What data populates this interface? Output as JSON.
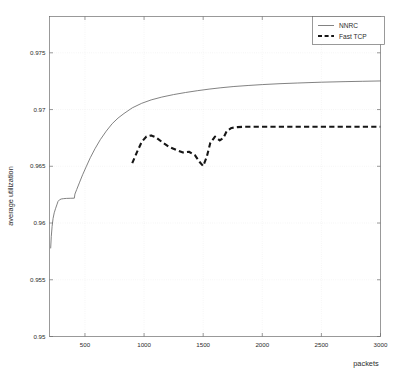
{
  "chart_data": {
    "type": "line",
    "title": "",
    "xlabel": "packets",
    "ylabel": "average utilization",
    "xlim": [
      200,
      3000
    ],
    "ylim": [
      0.95,
      0.9782
    ],
    "grid": true,
    "legend_position": "top-right",
    "xticks": [
      500,
      1000,
      1500,
      2000,
      2500,
      3000
    ],
    "xtick_labels": [
      "500",
      "1000",
      "1500",
      "2000",
      "2500",
      "3000"
    ],
    "yticks": [
      0.95,
      0.955,
      0.96,
      0.965,
      0.97,
      0.975
    ],
    "ytick_labels": [
      "0.95",
      "0.955",
      "0.96",
      "0.965",
      "0.97",
      "0.975"
    ],
    "series": [
      {
        "name": "NNRC",
        "style": "solid",
        "color": "#6b6b6b",
        "x": [
          210,
          215,
          222,
          230,
          240,
          252,
          262,
          272,
          285,
          300,
          320,
          345,
          375,
          410,
          415,
          430,
          455,
          480,
          510,
          545,
          585,
          630,
          680,
          730,
          780,
          830,
          900,
          980,
          1060,
          1150,
          1250,
          1350,
          1450,
          1550,
          1650,
          1760,
          1880,
          2000,
          2150,
          2300,
          2500,
          2700,
          2850,
          3000
        ],
        "y": [
          0.9578,
          0.9588,
          0.9597,
          0.9604,
          0.9609,
          0.9613,
          0.9616,
          0.9619,
          0.96205,
          0.96212,
          0.96215,
          0.96217,
          0.96218,
          0.96219,
          0.96255,
          0.96295,
          0.9636,
          0.96425,
          0.96495,
          0.96575,
          0.96655,
          0.96735,
          0.9681,
          0.96875,
          0.96925,
          0.96965,
          0.97015,
          0.97055,
          0.97085,
          0.9711,
          0.97132,
          0.9715,
          0.97166,
          0.9718,
          0.97192,
          0.97203,
          0.97212,
          0.9722,
          0.97228,
          0.97234,
          0.97241,
          0.97246,
          0.97249,
          0.97252
        ]
      },
      {
        "name": "Fast TCP",
        "style": "dashed",
        "color": "#161616",
        "x": [
          900,
          940,
          980,
          1020,
          1060,
          1100,
          1150,
          1210,
          1270,
          1330,
          1380,
          1430,
          1470,
          1500,
          1530,
          1560,
          1600,
          1640,
          1670,
          1700,
          1740,
          1790,
          1850,
          1950,
          2100,
          2300,
          2500,
          2700,
          2900,
          3000
        ],
        "y": [
          0.96528,
          0.96625,
          0.96715,
          0.96762,
          0.96772,
          0.96755,
          0.96715,
          0.96672,
          0.96645,
          0.96622,
          0.96628,
          0.96598,
          0.96538,
          0.96502,
          0.96582,
          0.96705,
          0.96762,
          0.96728,
          0.96748,
          0.96812,
          0.96838,
          0.96845,
          0.96848,
          0.96848,
          0.96848,
          0.96848,
          0.96848,
          0.96848,
          0.96848,
          0.96848
        ]
      }
    ]
  },
  "legend": {
    "entries": [
      {
        "label": "NNRC",
        "icon": "solid-line-swatch"
      },
      {
        "label": "Fast TCP",
        "icon": "dashed-line-swatch"
      }
    ]
  },
  "axes": {
    "x_axis_title": "packets",
    "y_axis_title": "average utilization"
  },
  "colors": {
    "nnrc": "#6b6b6b",
    "fast_tcp": "#161616",
    "grid": "#d8d8d8",
    "axis": "#6e6e6e",
    "background": "#ffffff"
  }
}
